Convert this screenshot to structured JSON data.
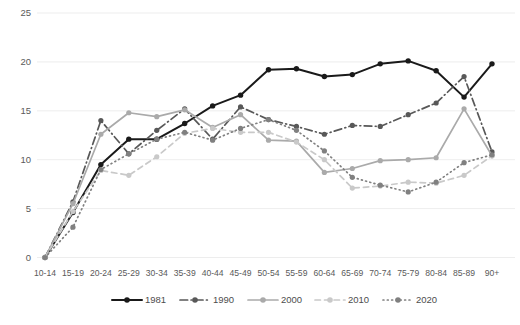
{
  "chart_data": {
    "type": "line",
    "title": "",
    "subtitle": "",
    "xlabel": "",
    "ylabel": "",
    "ylim": [
      0,
      25
    ],
    "yticks": [
      0,
      5,
      10,
      15,
      20,
      25
    ],
    "grid": true,
    "legend_position": "bottom",
    "categories": [
      "10-14",
      "15-19",
      "20-24",
      "25-29",
      "30-34",
      "35-39",
      "40-44",
      "45-49",
      "50-54",
      "55-59",
      "60-64",
      "65-69",
      "70-74",
      "75-79",
      "80-84",
      "85-89",
      "90+"
    ],
    "series": [
      {
        "name": "1981",
        "color": "#1a1a1a",
        "dash": "none",
        "values": [
          0,
          4.6,
          9.5,
          12.1,
          12.1,
          13.7,
          15.5,
          16.6,
          19.2,
          19.3,
          18.5,
          18.7,
          19.8,
          20.1,
          19.1,
          16.4,
          19.8
        ]
      },
      {
        "name": "1990",
        "color": "#585858",
        "dash": "dashdot",
        "values": [
          0,
          5.7,
          14.0,
          10.6,
          13.0,
          15.2,
          12.1,
          15.4,
          14.1,
          13.4,
          12.6,
          13.5,
          13.4,
          14.6,
          15.8,
          18.5,
          10.8
        ]
      },
      {
        "name": "2000",
        "color": "#aaaaaa",
        "dash": "none",
        "values": [
          0,
          5.5,
          12.6,
          14.8,
          14.4,
          15.1,
          13.3,
          14.6,
          12.0,
          11.9,
          8.7,
          9.1,
          9.9,
          10.0,
          10.2,
          15.2,
          10.4
        ]
      },
      {
        "name": "2010",
        "color": "#c9c9c9",
        "dash": "dashed",
        "values": [
          0,
          4.7,
          8.9,
          8.4,
          10.3,
          12.7,
          13.2,
          12.8,
          12.8,
          11.8,
          10.0,
          7.1,
          7.3,
          7.7,
          7.6,
          8.4,
          10.4
        ]
      },
      {
        "name": "2020",
        "color": "#808080",
        "dash": "dotted",
        "values": [
          0,
          3.1,
          9.0,
          10.6,
          12.1,
          12.8,
          12.0,
          13.2,
          14.1,
          13.0,
          10.9,
          8.2,
          7.4,
          6.7,
          7.7,
          9.7,
          10.5
        ]
      }
    ]
  },
  "legend": {
    "items": [
      {
        "label": "1981"
      },
      {
        "label": "1990"
      },
      {
        "label": "2000"
      },
      {
        "label": "2010"
      },
      {
        "label": "2020"
      }
    ]
  }
}
